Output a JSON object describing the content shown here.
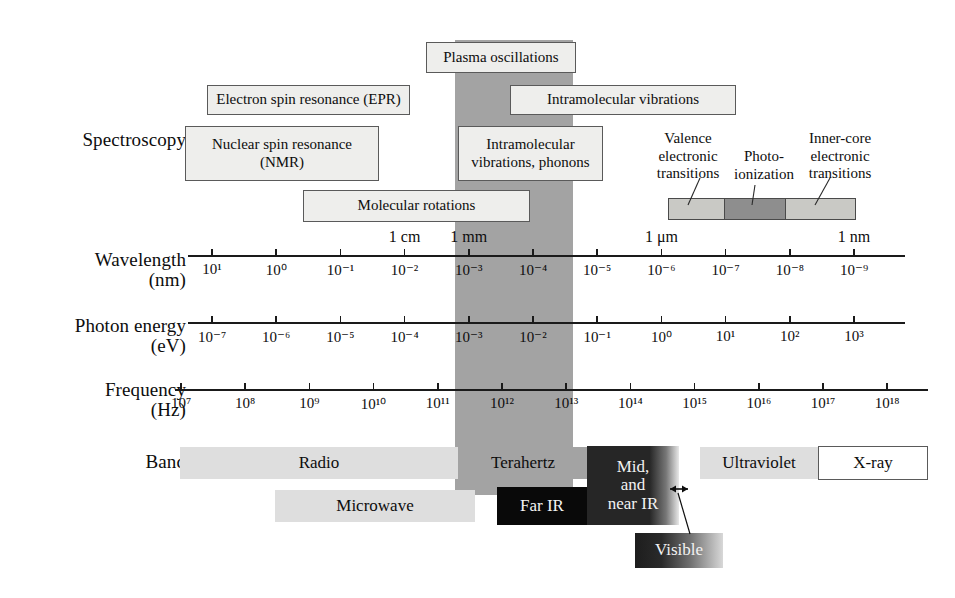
{
  "rows": {
    "spectroscopy": {
      "label": "Spectroscopy"
    },
    "wavelength": {
      "label": "Wavelength",
      "unit": "(nm)"
    },
    "photon_energy": {
      "label": "Photon energy",
      "unit": "(eV)"
    },
    "frequency": {
      "label": "Frequency",
      "unit": "(Hz)"
    },
    "band": {
      "label": "Band"
    }
  },
  "spectroscopy_boxes": [
    {
      "id": "plasma-oscillations",
      "text": "Plasma oscillations"
    },
    {
      "id": "electron-spin-resonance",
      "text": "Electron spin resonance (EPR)"
    },
    {
      "id": "intramolecular-vibrations",
      "text": "Intramolecular vibrations"
    },
    {
      "id": "nuclear-spin-resonance",
      "line1": "Nuclear spin resonance",
      "line2": "(NMR)"
    },
    {
      "id": "intramolecular-vibrations-phonons",
      "line1": "Intramolecular",
      "line2": "vibrations, phonons"
    },
    {
      "id": "molecular-rotations",
      "text": "Molecular rotations"
    }
  ],
  "transition_annotations": [
    {
      "id": "valence-electronic-transitions",
      "line1": "Valence",
      "line2": "electronic",
      "line3": "transitions"
    },
    {
      "id": "photo-ionization",
      "line1": "Photo-",
      "line2": "ionization",
      "line3": ""
    },
    {
      "id": "inner-core-electronic-transitions",
      "line1": "Inner-core",
      "line2": "electronic",
      "line3": "transitions"
    }
  ],
  "transition_bar_segments": [
    {
      "id": "valence-segment",
      "shade": "light"
    },
    {
      "id": "photoionization-segment",
      "shade": "dark"
    },
    {
      "id": "innercore-segment",
      "shade": "light"
    }
  ],
  "axes": {
    "wavelength": {
      "label": "Wavelength",
      "unit": "(nm)",
      "ticks": [
        "10¹",
        "10⁰",
        "10⁻¹",
        "10⁻²",
        "10⁻³",
        "10⁻⁴",
        "10⁻⁵",
        "10⁻⁶",
        "10⁻⁷",
        "10⁻⁸",
        "10⁻⁹"
      ],
      "exponents": [
        1,
        0,
        -1,
        -2,
        -3,
        -4,
        -5,
        -6,
        -7,
        -8,
        -9
      ],
      "over_labels": [
        {
          "text": "1 cm",
          "at_exponent": -2
        },
        {
          "text": "1 mm",
          "at_exponent": -3
        },
        {
          "text": "1 μm",
          "at_exponent": -6
        },
        {
          "text": "1 nm",
          "at_exponent": -9
        }
      ]
    },
    "photon_energy": {
      "label": "Photon energy",
      "unit": "(eV)",
      "ticks": [
        "10⁻⁷",
        "10⁻⁶",
        "10⁻⁵",
        "10⁻⁴",
        "10⁻³",
        "10⁻²",
        "10⁻¹",
        "10⁰",
        "10¹",
        "10²",
        "10³"
      ],
      "exponents": [
        -7,
        -6,
        -5,
        -4,
        -3,
        -2,
        -1,
        0,
        1,
        2,
        3
      ]
    },
    "frequency": {
      "label": "Frequency",
      "unit": "(Hz)",
      "ticks": [
        "10⁷",
        "10⁸",
        "10⁹",
        "10¹⁰",
        "10¹¹",
        "10¹²",
        "10¹³",
        "10¹⁴",
        "10¹⁵",
        "10¹⁶",
        "10¹⁷",
        "10¹⁸"
      ],
      "exponents": [
        7,
        8,
        9,
        10,
        11,
        12,
        13,
        14,
        15,
        16,
        17,
        18
      ]
    }
  },
  "bands": [
    {
      "id": "radio",
      "label": "Radio",
      "shade": "light"
    },
    {
      "id": "terahertz",
      "label": "Terahertz",
      "shade": "mid"
    },
    {
      "id": "ultraviolet",
      "label": "Ultraviolet",
      "shade": "light"
    },
    {
      "id": "xray",
      "label": "X-ray",
      "shade": "white"
    },
    {
      "id": "microwave",
      "label": "Microwave",
      "shade": "light"
    },
    {
      "id": "far-ir",
      "label": "Far IR",
      "shade": "black"
    },
    {
      "id": "mid-near-ir",
      "line1": "Mid,",
      "line2": "and",
      "line3": "near IR",
      "shade": "dark-gradient"
    },
    {
      "id": "visible",
      "label": "Visible",
      "shade": "gradient"
    }
  ],
  "colors": {
    "terahertz_column": "#a3a3a3",
    "box_fill": "#eeeeec",
    "box_border": "#5a5a5a",
    "band_light": "#dedede",
    "band_mid": "#a3a3a3",
    "band_black": "#090909",
    "axis_line": "#1a1a1a",
    "page_background": "#ffffff"
  }
}
